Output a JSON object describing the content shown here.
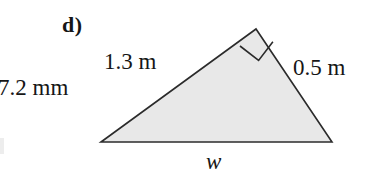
{
  "figure": {
    "part_label": "d)",
    "neighbor_label": "7.2 mm",
    "labels": {
      "side_a": "1.3 m",
      "side_b": "0.5 m",
      "base": "w"
    },
    "colors": {
      "background": "#ffffff",
      "fill": "#e8e8e8",
      "stroke": "#2b2b2b",
      "text": "#161616"
    },
    "geometry": {
      "shape": "right-triangle",
      "vertices": {
        "left": [
          101,
          142
        ],
        "apex": [
          256,
          29
        ],
        "right": [
          332,
          142
        ]
      },
      "right_angle_at": "apex",
      "right_angle_marker_size": 26
    }
  }
}
